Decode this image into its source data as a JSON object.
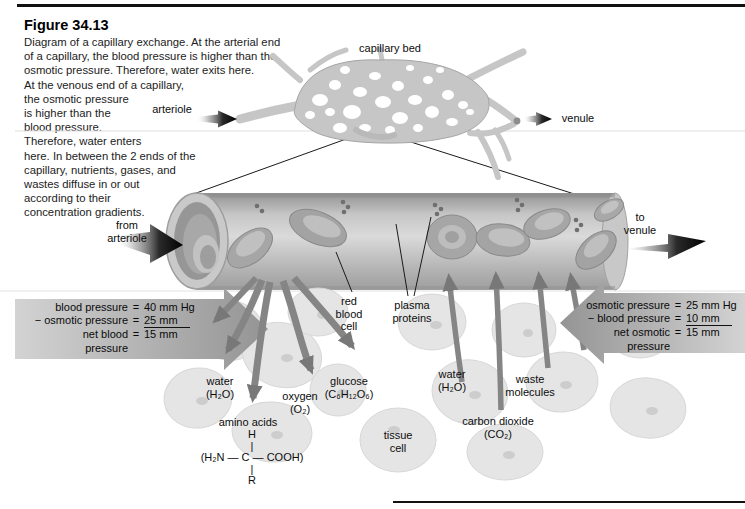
{
  "figure": {
    "number": "Figure 34.13",
    "caption_lines": [
      "Diagram of a capillary exchange. At the arterial end",
      "of a capillary, the blood pressure is higher than the",
      "osmotic pressure. Therefore, water exits here.",
      "At the venous end of a capillary,",
      "the osmotic pressure",
      "is higher than the",
      "blood pressure.",
      "Therefore, water enters",
      "here. In between the 2 ends of the",
      "capillary, nutrients, gases, and",
      "wastes diffuse in or out",
      "according to their",
      "concentration gradients."
    ]
  },
  "top_labels": {
    "capillary_bed": "capillary bed",
    "arteriole": "arteriole",
    "venule": "venule"
  },
  "flow_labels": {
    "from_arteriole": "from\narteriole",
    "to_venule": "to\nvenule"
  },
  "capillary_labels": {
    "red_blood_cell": "red\nblood\ncell",
    "plasma_proteins": "plasma\nproteins"
  },
  "pressure_left": {
    "rows": [
      {
        "label": "blood pressure",
        "eq": "=",
        "value": "40 mm Hg"
      },
      {
        "label": "− osmotic pressure",
        "eq": "=",
        "value": "25 mm"
      },
      {
        "label": "net blood",
        "eq": "=",
        "value": "15 mm"
      },
      {
        "label": "pressure",
        "eq": "",
        "value": ""
      }
    ]
  },
  "pressure_right": {
    "rows": [
      {
        "label": "osmotic pressure",
        "eq": "=",
        "value": "25 mm Hg"
      },
      {
        "label": "− blood pressure",
        "eq": "=",
        "value": "10 mm"
      },
      {
        "label": "net osmotic",
        "eq": "=",
        "value": "15 mm"
      },
      {
        "label": "pressure",
        "eq": "",
        "value": ""
      }
    ]
  },
  "exchange_labels": {
    "water_out": "water\n(H₂O)",
    "oxygen": "oxygen\n(O₂)",
    "glucose": "glucose\n(C₆H₁₂O₆)",
    "amino_acids": "amino acids",
    "amino_formula": "H\n|\n(H₂N — C — COOH)\n|\nR",
    "tissue_cell": "tissue\ncell",
    "water_in": "water\n(H₂O)",
    "waste": "waste\nmolecules",
    "carbon_dioxide": "carbon dioxide\n(CO₂)"
  },
  "colors": {
    "ink": "#111111",
    "transport_arrow_gray": "#858585",
    "pressure_arrow_gray": "#9a9a9a",
    "tissue_cell_fill": "#e5e5e5",
    "vessel_gray": "#c6c6c6",
    "background": "#ffffff"
  }
}
